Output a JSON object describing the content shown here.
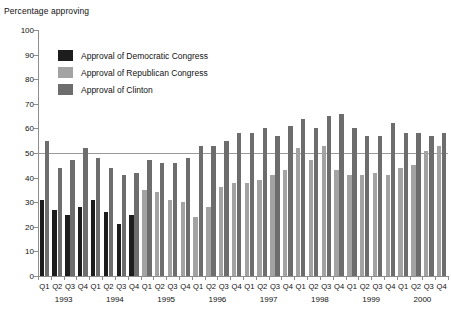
{
  "chart_data": {
    "type": "bar",
    "title": "",
    "ylabel": "Percentage approving",
    "xlabel": "",
    "ylim": [
      0,
      100
    ],
    "yticks": [
      0,
      10,
      20,
      30,
      40,
      50,
      60,
      70,
      80,
      90,
      100
    ],
    "grid": false,
    "reference_line": 50,
    "legend_position": "inside-top-left",
    "categories": [
      "Q1 1993",
      "Q2 1993",
      "Q3 1993",
      "Q4 1993",
      "Q1 1994",
      "Q2 1994",
      "Q3 1994",
      "Q4 1994",
      "Q1 1995",
      "Q2 1995",
      "Q3 1995",
      "Q4 1995",
      "Q1 1996",
      "Q2 1996",
      "Q3 1996",
      "Q4 1996",
      "Q1 1997",
      "Q2 1997",
      "Q3 1997",
      "Q4 1997",
      "Q1 1998",
      "Q2 1998",
      "Q3 1998",
      "Q4 1998",
      "Q1 1999",
      "Q2 1999",
      "Q3 1999",
      "Q4 1999",
      "Q1 2000",
      "Q2 2000",
      "Q3 2000",
      "Q4 2000"
    ],
    "quarter_labels": [
      "Q1",
      "Q2",
      "Q3",
      "Q4",
      "Q1",
      "Q2",
      "Q3",
      "Q4",
      "Q1",
      "Q2",
      "Q3",
      "Q4",
      "Q1",
      "Q2",
      "Q3",
      "Q4",
      "Q1",
      "Q2",
      "Q3",
      "Q4",
      "Q1",
      "Q2",
      "Q3",
      "Q4",
      "Q1",
      "Q2",
      "Q3",
      "Q4",
      "Q1",
      "Q2",
      "Q3",
      "Q4"
    ],
    "year_labels": [
      "1993",
      "1994",
      "1995",
      "1996",
      "1997",
      "1998",
      "1999",
      "2000"
    ],
    "series": [
      {
        "name": "Approval of Democratic Congress",
        "key": "dem",
        "color": "#1d1d1d",
        "values": [
          31,
          27,
          25,
          28,
          31,
          26,
          21,
          25,
          null,
          null,
          null,
          null,
          null,
          null,
          null,
          null,
          null,
          null,
          null,
          null,
          null,
          null,
          null,
          null,
          null,
          null,
          null,
          null,
          null,
          null,
          null,
          null
        ]
      },
      {
        "name": "Approval of Republican Congress",
        "key": "rep",
        "color": "#a3a3a3",
        "values": [
          null,
          null,
          null,
          null,
          null,
          null,
          null,
          null,
          35,
          34,
          31,
          30,
          24,
          28,
          36,
          38,
          38,
          39,
          41,
          43,
          52,
          47,
          53,
          43,
          41,
          41,
          42,
          41,
          44,
          45,
          51,
          53
        ]
      },
      {
        "name": "Approval of Clinton",
        "key": "clinton",
        "color": "#6d6d6d",
        "values": [
          55,
          44,
          47,
          52,
          48,
          44,
          41,
          42,
          47,
          46,
          46,
          48,
          53,
          53,
          55,
          58,
          58,
          60,
          57,
          61,
          64,
          60,
          65,
          66,
          60,
          57,
          57,
          62,
          58,
          58,
          57,
          58
        ]
      }
    ]
  },
  "legend": {
    "items": [
      {
        "label": "Approval of Democratic Congress",
        "color": "#1d1d1d"
      },
      {
        "label": "Approval of Republican Congress",
        "color": "#a3a3a3"
      },
      {
        "label": "Approval of Clinton",
        "color": "#6d6d6d"
      }
    ]
  }
}
